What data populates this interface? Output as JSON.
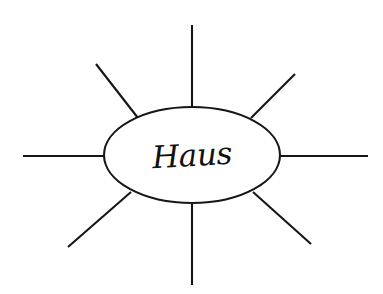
{
  "diagram": {
    "type": "cluster-diagram",
    "title_shown": false,
    "background_color": "#ffffff",
    "ink_color": "#161616",
    "center_node": {
      "label": "Haus",
      "shape": "ellipse",
      "handwritten": true,
      "center_x": 192,
      "center_y": 155,
      "radius_x": 88,
      "radius_y": 48
    },
    "spoke_count": 8,
    "spokes": [
      {
        "name": "spoke-north",
        "direction": "up",
        "label": "",
        "x1": 192,
        "y1": 107,
        "x2": 192,
        "y2": 25
      },
      {
        "name": "spoke-northeast",
        "direction": "up-right",
        "label": "",
        "x1": 251,
        "y1": 118,
        "x2": 295,
        "y2": 74
      },
      {
        "name": "spoke-east",
        "direction": "right",
        "label": "",
        "x1": 280,
        "y1": 156,
        "x2": 368,
        "y2": 156
      },
      {
        "name": "spoke-southeast",
        "direction": "down-right",
        "label": "",
        "x1": 253,
        "y1": 192,
        "x2": 311,
        "y2": 244
      },
      {
        "name": "spoke-south",
        "direction": "down",
        "label": "",
        "x1": 192,
        "y1": 203,
        "x2": 192,
        "y2": 285
      },
      {
        "name": "spoke-southwest",
        "direction": "down-left",
        "label": "",
        "x1": 131,
        "y1": 192,
        "x2": 68,
        "y2": 247
      },
      {
        "name": "spoke-west",
        "direction": "left",
        "label": "",
        "x1": 104,
        "y1": 156,
        "x2": 23,
        "y2": 156
      },
      {
        "name": "spoke-northwest",
        "direction": "up-left",
        "label": "",
        "x1": 138,
        "y1": 118,
        "x2": 96,
        "y2": 64
      }
    ]
  }
}
